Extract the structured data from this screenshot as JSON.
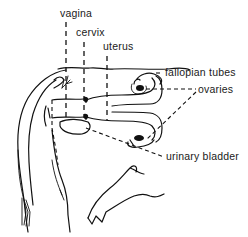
{
  "diagram": {
    "labels": {
      "vagina": "vagina",
      "cervix": "cervix",
      "uterus": "uterus",
      "fallopian_tubes": "fallopian tubes",
      "ovaries": "ovaries",
      "urinary_bladder": "urinary bladder"
    },
    "colors": {
      "ink": "#111111",
      "background": "#ffffff"
    }
  }
}
